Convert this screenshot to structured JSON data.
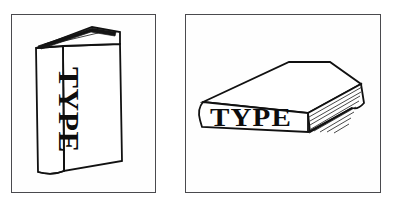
{
  "figure": {
    "background_color": "#ffffff",
    "ink_color": "#111111",
    "frame_color": "#4a4a4e",
    "panels": [
      {
        "id": "standing-book",
        "name": "standing-book-panel",
        "book_label": "TYPE",
        "orientation": "upright",
        "label_orientation": "vertical-top-to-bottom",
        "caption": ""
      },
      {
        "id": "lying-book",
        "name": "lying-book-panel",
        "book_label": "TYPE",
        "orientation": "flat",
        "label_orientation": "horizontal",
        "caption": ""
      }
    ]
  }
}
